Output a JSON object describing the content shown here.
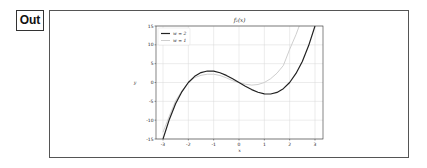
{
  "cell": {
    "prompt_label": "Out"
  },
  "chart_data": {
    "type": "line",
    "title": "f₂(x)",
    "xlabel": "x",
    "ylabel": "y",
    "xlim": [
      -3.3,
      3.3
    ],
    "ylim": [
      -15,
      15
    ],
    "xticks": [
      -3,
      -2,
      -1,
      0,
      1,
      2,
      3
    ],
    "yticks": [
      -15,
      -10,
      -5,
      0,
      5,
      10,
      15
    ],
    "xtick_labels": [
      "-3",
      "-2",
      "-1",
      "0",
      "1",
      "2",
      "3"
    ],
    "ytick_labels": [
      "-15",
      "-10",
      "-5",
      "0",
      "5",
      "10",
      "15"
    ],
    "grid": true,
    "legend_position": "upper left",
    "x": [
      -3,
      -2.75,
      -2.5,
      -2.25,
      -2,
      -1.75,
      -1.5,
      -1.25,
      -1,
      -0.75,
      -0.5,
      -0.25,
      0,
      0.25,
      0.5,
      0.75,
      1,
      1.25,
      1.5,
      1.75,
      2,
      2.25,
      2.5,
      2.75,
      3
    ],
    "series": [
      {
        "name": "w = 2",
        "color": "#222222",
        "width": 1.2,
        "values": [
          -15,
          -9.8,
          -5.6,
          -2.4,
          0,
          1.64,
          2.63,
          3.05,
          3,
          2.58,
          1.88,
          0.98,
          0,
          -0.98,
          -1.88,
          -2.58,
          -3,
          -3.05,
          -2.63,
          -1.64,
          0,
          2.4,
          5.6,
          9.8,
          15
        ]
      },
      {
        "name": "w = 1",
        "color": "#c8c8c8",
        "width": 0.9,
        "values": [
          -13.2,
          -8.9,
          -4.8,
          -2.2,
          0,
          1.3,
          1.9,
          2.2,
          2.2,
          1.86,
          1.24,
          0.48,
          0,
          -0.46,
          -0.69,
          -0.53,
          0,
          1.01,
          2.48,
          4.5,
          8.8,
          12.7,
          17.2,
          22.9,
          29.7
        ]
      }
    ]
  }
}
